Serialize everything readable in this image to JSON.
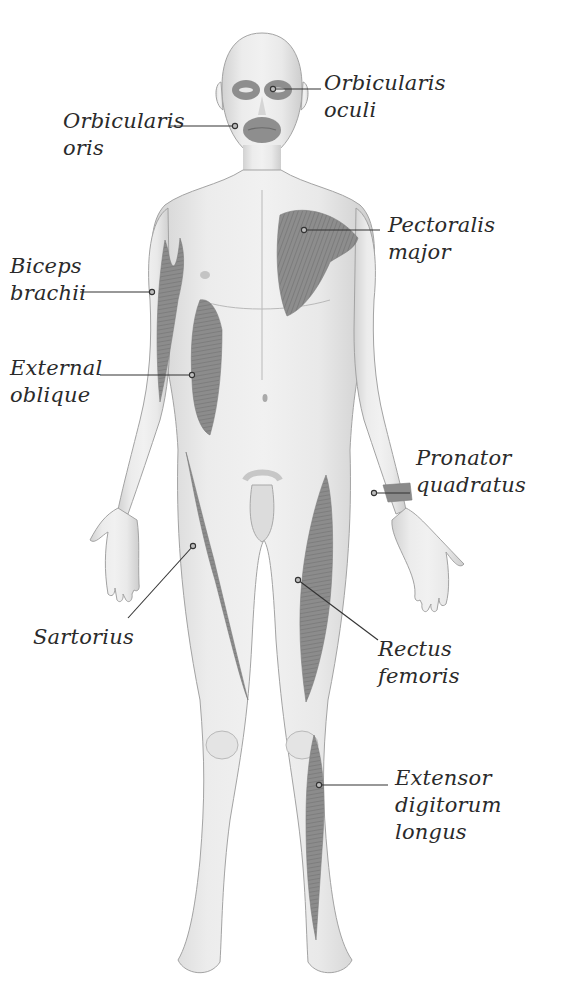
{
  "diagram": {
    "colors": {
      "background": "#ffffff",
      "skin": "#e6e6e6",
      "skin_shadow": "#cfcfcf",
      "muscle": "#8f8f8f",
      "outline": "#9a9a9a",
      "leader_line": "#333333",
      "text": "#2a2a2a"
    },
    "labels": [
      {
        "id": "orbicularis-oculi",
        "lines": [
          "Orbicularis",
          "oculi"
        ],
        "side": "right",
        "text_pos": [
          324,
          70
        ],
        "anchor": [
          273,
          89
        ]
      },
      {
        "id": "orbicularis-oris",
        "lines": [
          "Orbicularis",
          "oris"
        ],
        "side": "left",
        "text_pos": [
          63,
          108
        ],
        "anchor": [
          235,
          126
        ]
      },
      {
        "id": "pectoralis-major",
        "lines": [
          "Pectoralis",
          "major"
        ],
        "side": "right",
        "text_pos": [
          388,
          212
        ],
        "anchor": [
          304,
          230
        ]
      },
      {
        "id": "biceps-brachii",
        "lines": [
          "Biceps",
          "brachii"
        ],
        "side": "left",
        "text_pos": [
          10,
          253
        ],
        "anchor": [
          152,
          292
        ]
      },
      {
        "id": "external-oblique",
        "lines": [
          "External",
          "oblique"
        ],
        "side": "left",
        "text_pos": [
          10,
          355
        ],
        "anchor": [
          192,
          375
        ]
      },
      {
        "id": "pronator-quadratus",
        "lines": [
          "Pronator",
          "quadratus"
        ],
        "side": "right",
        "text_pos": [
          416,
          445
        ],
        "anchor": [
          374,
          493
        ]
      },
      {
        "id": "sartorius",
        "lines": [
          "Sartorius"
        ],
        "side": "left",
        "text_pos": [
          33,
          624
        ],
        "anchor": [
          193,
          546
        ]
      },
      {
        "id": "rectus-femoris",
        "lines": [
          "Rectus",
          "femoris"
        ],
        "side": "right",
        "text_pos": [
          378,
          636
        ],
        "anchor": [
          298,
          580
        ]
      },
      {
        "id": "extensor-digitorum-longus",
        "lines": [
          "Extensor",
          "digitorum",
          "longus"
        ],
        "side": "right",
        "text_pos": [
          395,
          765
        ],
        "anchor": [
          319,
          785
        ]
      }
    ]
  }
}
